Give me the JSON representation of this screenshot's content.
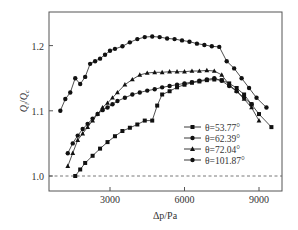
{
  "chart_data": {
    "type": "line",
    "title": "",
    "xlabel": "Δp/Pa",
    "ylabel": "Q_i/Q_c",
    "xlim": [
      500,
      9800
    ],
    "ylim": [
      0.975,
      1.25
    ],
    "xticks": [
      "3000",
      "6000",
      "9000"
    ],
    "yticks": [
      "1.0",
      "1.1",
      "1.2"
    ],
    "grid": false,
    "reference_line": {
      "y": 1.0,
      "style": "dashed"
    },
    "legend_position": "lower right inside",
    "series": [
      {
        "name": "θ=53.77°",
        "marker": "square",
        "x": [
          1600,
          1800,
          2000,
          2300,
          2600,
          2900,
          3200,
          3500,
          3800,
          4100,
          4400,
          4700,
          4900,
          5100,
          5400,
          5700,
          6000,
          6300,
          6600,
          6900,
          7200,
          7500,
          7800,
          8100,
          8400,
          8700,
          9000,
          9500
        ],
        "values": [
          1.0,
          1.01,
          1.02,
          1.031,
          1.042,
          1.052,
          1.061,
          1.069,
          1.074,
          1.079,
          1.085,
          1.085,
          1.108,
          1.125,
          1.13,
          1.136,
          1.14,
          1.143,
          1.145,
          1.147,
          1.148,
          1.147,
          1.142,
          1.135,
          1.125,
          1.11,
          1.095,
          1.075
        ]
      },
      {
        "name": "θ=62.39°",
        "marker": "circle",
        "x": [
          1000,
          1200,
          1400,
          1600,
          1800,
          2000,
          2200,
          2400,
          2600,
          2800,
          3000,
          3200,
          3500,
          3800,
          4100,
          4400,
          4700,
          5000,
          5300,
          5600,
          5900,
          6200,
          6500,
          6800,
          7100,
          7400,
          7700,
          8000,
          8300,
          8600,
          8900,
          9300
        ],
        "values": [
          1.1,
          1.118,
          1.128,
          1.15,
          1.141,
          1.152,
          1.172,
          1.176,
          1.18,
          1.186,
          1.192,
          1.195,
          1.199,
          1.205,
          1.21,
          1.213,
          1.214,
          1.213,
          1.211,
          1.21,
          1.208,
          1.206,
          1.203,
          1.201,
          1.199,
          1.198,
          1.176,
          1.165,
          1.15,
          1.135,
          1.12,
          1.105
        ]
      },
      {
        "name": "θ=72.04°",
        "marker": "triangle",
        "x": [
          1300,
          1500,
          1700,
          1900,
          2100,
          2300,
          2500,
          2700,
          2900,
          3100,
          3300,
          3600,
          3900,
          4200,
          4500,
          4800,
          5100,
          5400,
          5700,
          6000,
          6300,
          6600,
          6900,
          7200,
          7500,
          7800,
          8100,
          8400,
          8700,
          9000
        ],
        "values": [
          1.015,
          1.035,
          1.055,
          1.065,
          1.075,
          1.085,
          1.095,
          1.105,
          1.112,
          1.12,
          1.128,
          1.14,
          1.148,
          1.155,
          1.158,
          1.159,
          1.159,
          1.16,
          1.16,
          1.16,
          1.161,
          1.161,
          1.162,
          1.161,
          1.155,
          1.14,
          1.13,
          1.118,
          1.105,
          1.085
        ]
      },
      {
        "name": "θ=101.87°",
        "marker": "circle",
        "x": [
          1300,
          1500,
          1700,
          1900,
          2100,
          2300,
          2500,
          2700,
          2900,
          3100,
          3300,
          3600,
          3900,
          4200,
          4500,
          4800,
          5100,
          5400,
          5700,
          6000,
          6300,
          6600,
          6900,
          7200,
          7500,
          7800,
          8100,
          8400,
          8700
        ],
        "values": [
          1.035,
          1.05,
          1.062,
          1.072,
          1.08,
          1.088,
          1.095,
          1.101,
          1.105,
          1.11,
          1.115,
          1.12,
          1.125,
          1.128,
          1.131,
          1.133,
          1.136,
          1.138,
          1.14,
          1.142,
          1.144,
          1.146,
          1.148,
          1.15,
          1.146,
          1.138,
          1.13,
          1.12,
          1.11
        ]
      }
    ]
  },
  "axes": {
    "xlabel": "Δp/Pa",
    "ylabel_main": "Q",
    "ylabel_sub1": "i",
    "ylabel_sep": "/",
    "ylabel_main2": "Q",
    "ylabel_sub2": "c",
    "xticks": [
      "3000",
      "6000",
      "9000"
    ],
    "yticks": [
      "1.0",
      "1.1",
      "1.2"
    ]
  },
  "legend": [
    {
      "label": "θ=53.77°",
      "marker": "square"
    },
    {
      "label": "θ=62.39°",
      "marker": "circle"
    },
    {
      "label": "θ=72.04°",
      "marker": "triangle"
    },
    {
      "label": "θ=101.87°",
      "marker": "circle"
    }
  ]
}
